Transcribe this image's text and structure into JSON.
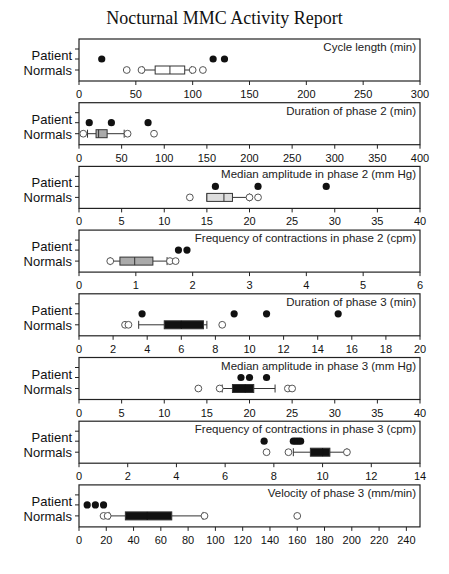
{
  "title": "Nocturnal MMC Activity Report",
  "row_labels": {
    "patient": "Patient",
    "normals": "Normals"
  },
  "chart_data": [
    {
      "type": "box",
      "title": "Cycle length (min)",
      "xlim": [
        0,
        300
      ],
      "ticks": [
        0,
        50,
        100,
        150,
        200,
        250,
        300
      ],
      "patient": [
        20,
        118,
        128
      ],
      "normals": {
        "whisker_low": 56,
        "q1": 67,
        "median": 80,
        "q3": 93,
        "whisker_high": 99,
        "fill": "white",
        "outliers": [
          42,
          55,
          100,
          109
        ]
      }
    },
    {
      "type": "box",
      "title": "Duration of phase 2 (min)",
      "xlim": [
        0,
        400
      ],
      "ticks": [
        0,
        50,
        100,
        150,
        200,
        250,
        300,
        350,
        400
      ],
      "patient": [
        12,
        38,
        81
      ],
      "normals": {
        "whisker_low": 10,
        "q1": 20,
        "median": 23,
        "q3": 33,
        "whisker_high": 53,
        "fill": "gray",
        "outliers": [
          5,
          57,
          88
        ]
      }
    },
    {
      "type": "box",
      "title": "Median amplitude in phase 2 (mm Hg)",
      "xlim": [
        0,
        40
      ],
      "ticks": [
        0,
        5,
        10,
        15,
        20,
        25,
        30,
        35,
        40
      ],
      "patient": [
        16,
        21,
        29
      ],
      "normals": {
        "whisker_low": 15,
        "q1": 15,
        "median": 17,
        "q3": 18,
        "whisker_high": 20,
        "fill": "lightgray",
        "outliers": [
          13,
          20,
          21
        ]
      }
    },
    {
      "type": "box",
      "title": "Frequency of contractions in phase 2 (cpm)",
      "xlim": [
        0,
        6
      ],
      "ticks": [
        0,
        1,
        2,
        3,
        4,
        5,
        6
      ],
      "patient": [
        1.75,
        1.9
      ],
      "normals": {
        "whisker_low": 0.55,
        "q1": 0.72,
        "median": 0.98,
        "q3": 1.3,
        "whisker_high": 1.55,
        "fill": "gray",
        "outliers": [
          0.55,
          1.6,
          1.7
        ]
      }
    },
    {
      "type": "box",
      "title": "Duration of phase 3 (min)",
      "xlim": [
        0,
        20
      ],
      "ticks": [
        0,
        2,
        4,
        6,
        8,
        10,
        12,
        14,
        16,
        18,
        20
      ],
      "patient": [
        3.7,
        9.1,
        11.0,
        15.2
      ],
      "normals": {
        "whisker_low": 3.5,
        "q1": 5.0,
        "median": 6.0,
        "q3": 7.3,
        "whisker_high": 7.5,
        "fill": "black",
        "outliers": [
          2.7,
          2.9,
          8.4
        ]
      }
    },
    {
      "type": "box",
      "title": "Median amplitude in phase 3 (mm Hg)",
      "xlim": [
        0,
        40
      ],
      "ticks": [
        0,
        5,
        10,
        15,
        20,
        25,
        30,
        35,
        40
      ],
      "patient": [
        19,
        20,
        22
      ],
      "normals": {
        "whisker_low": 16.8,
        "q1": 18,
        "median": 19.5,
        "q3": 20.5,
        "whisker_high": 23,
        "fill": "black",
        "outliers": [
          14,
          16.5,
          24.5,
          25
        ]
      }
    },
    {
      "type": "box",
      "title": "Frequency of contractions in phase 3 (cpm)",
      "xlim": [
        0,
        14
      ],
      "ticks": [
        0,
        2,
        4,
        6,
        8,
        10,
        12,
        14
      ],
      "patient": [
        7.6,
        8.8,
        8.9,
        9.0,
        9.1
      ],
      "normals": {
        "whisker_low": 8.8,
        "q1": 9.5,
        "median": 10,
        "q3": 10.3,
        "whisker_high": 11,
        "fill": "black",
        "outliers": [
          7.7,
          8.6,
          11
        ]
      }
    },
    {
      "type": "box",
      "title": "Velocity of phase 3 (mm/min)",
      "xlim": [
        0,
        250
      ],
      "ticks": [
        0,
        20,
        40,
        60,
        80,
        100,
        120,
        140,
        160,
        180,
        200,
        220,
        240
      ],
      "patient": [
        6,
        12,
        18
      ],
      "normals": {
        "whisker_low": 22,
        "q1": 34,
        "median": 50,
        "q3": 68,
        "whisker_high": 91,
        "fill": "black",
        "outliers": [
          18,
          21,
          92,
          160
        ]
      }
    }
  ]
}
